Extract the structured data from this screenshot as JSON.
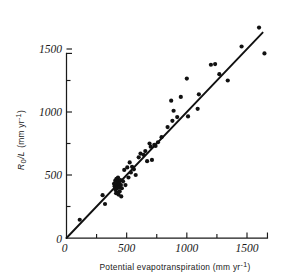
{
  "figure": {
    "background_color": "#ffffff",
    "ink_color": "#111111",
    "width": 304,
    "height": 280
  },
  "axes": {
    "x": {
      "title_main": "Potential evapotranspiration (mm yr",
      "title_sup": "-1",
      "title_close": ")",
      "title_full": "Potential evapotranspiration (mm yr-1)",
      "ticks_major": [
        0,
        500,
        1000,
        1500
      ],
      "tick_labels": [
        "0",
        "500",
        "1000",
        "1500"
      ],
      "ticks_minor": [
        250,
        750,
        1250,
        1750
      ],
      "range": [
        0,
        1700
      ],
      "axis_end_value": 1670
    },
    "y": {
      "title_var": "R",
      "title_sub": "0",
      "title_slash": "/L",
      "title_units": "(mm yr",
      "title_sup": "-1",
      "title_close": ")",
      "title_full": "R0/L (mm yr-1)",
      "ticks_major": [
        0,
        500,
        1000,
        1500
      ],
      "tick_labels": [
        "0",
        "500",
        "1000",
        "1500"
      ],
      "ticks_minor": [
        250,
        750,
        1250
      ],
      "range": [
        0,
        1470
      ],
      "axis_end_value": 1465
    },
    "origin_label": "0"
  },
  "chart_data": {
    "type": "scatter",
    "title": "",
    "xlabel": "Potential evapotranspiration (mm yr-1)",
    "ylabel": "R0/L (mm yr-1)",
    "xlim": [
      0,
      1700
    ],
    "ylim": [
      0,
      1470
    ],
    "grid": false,
    "legend": "none",
    "marker": {
      "shape": "circle",
      "color": "#111111",
      "size_px": 4.2
    },
    "series": [
      {
        "name": "Catchment observations",
        "points": [
          [
            110,
            145
          ],
          [
            300,
            340
          ],
          [
            320,
            270
          ],
          [
            395,
            430
          ],
          [
            400,
            410
          ],
          [
            405,
            455
          ],
          [
            408,
            380
          ],
          [
            412,
            355
          ],
          [
            415,
            470
          ],
          [
            418,
            425
          ],
          [
            420,
            395
          ],
          [
            422,
            440
          ],
          [
            425,
            360
          ],
          [
            428,
            480
          ],
          [
            430,
            415
          ],
          [
            432,
            345
          ],
          [
            435,
            455
          ],
          [
            438,
            400
          ],
          [
            440,
            430
          ],
          [
            442,
            370
          ],
          [
            448,
            460
          ],
          [
            452,
            420
          ],
          [
            455,
            330
          ],
          [
            460,
            395
          ],
          [
            470,
            450
          ],
          [
            480,
            540
          ],
          [
            490,
            420
          ],
          [
            505,
            560
          ],
          [
            515,
            480
          ],
          [
            525,
            600
          ],
          [
            535,
            520
          ],
          [
            545,
            565
          ],
          [
            560,
            545
          ],
          [
            575,
            500
          ],
          [
            600,
            640
          ],
          [
            615,
            670
          ],
          [
            640,
            660
          ],
          [
            655,
            690
          ],
          [
            670,
            610
          ],
          [
            690,
            750
          ],
          [
            700,
            725
          ],
          [
            710,
            620
          ],
          [
            730,
            740
          ],
          [
            740,
            730
          ],
          [
            760,
            760
          ],
          [
            790,
            800
          ],
          [
            840,
            880
          ],
          [
            870,
            1090
          ],
          [
            880,
            930
          ],
          [
            890,
            1010
          ],
          [
            920,
            960
          ],
          [
            950,
            1120
          ],
          [
            1000,
            1265
          ],
          [
            1010,
            965
          ],
          [
            1090,
            1025
          ],
          [
            1100,
            1140
          ],
          [
            1200,
            1375
          ],
          [
            1235,
            1380
          ],
          [
            1270,
            1300
          ],
          [
            1340,
            1250
          ],
          [
            1455,
            1520
          ],
          [
            1600,
            1670
          ],
          [
            1645,
            1465
          ]
        ]
      }
    ],
    "fit_line": {
      "name": "1:1 regression line",
      "x_start": 0,
      "y_start": 0,
      "x_end": 1630,
      "y_end": 1630,
      "style": "solid",
      "color": "#111111"
    }
  }
}
